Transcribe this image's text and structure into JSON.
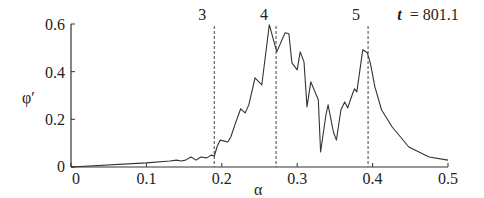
{
  "chart_data": {
    "type": "line",
    "title": "",
    "xlabel": "α",
    "ylabel": "φ′",
    "xlim": [
      0,
      0.5
    ],
    "ylim": [
      0,
      0.6
    ],
    "grid": false,
    "legend": null,
    "x_ticks": [
      "0",
      "0.1",
      "0.2",
      "0.3",
      "0.4",
      "0.5"
    ],
    "y_ticks": [
      "0",
      "0.2",
      "0.4",
      "0.6"
    ],
    "annotation": {
      "t_label": "t",
      "t_value": "= 801.1"
    },
    "vlines": [
      {
        "label": "3",
        "x": 0.19
      },
      {
        "label": "4",
        "x": 0.272
      },
      {
        "label": "5",
        "x": 0.394
      }
    ],
    "series": [
      {
        "name": "φ′",
        "x": [
          0.0,
          0.1,
          0.131,
          0.14,
          0.146,
          0.152,
          0.159,
          0.166,
          0.172,
          0.18,
          0.186,
          0.19,
          0.194,
          0.198,
          0.208,
          0.212,
          0.218,
          0.225,
          0.231,
          0.236,
          0.244,
          0.253,
          0.263,
          0.273,
          0.284,
          0.289,
          0.293,
          0.3,
          0.304,
          0.309,
          0.313,
          0.318,
          0.328,
          0.331,
          0.338,
          0.341,
          0.348,
          0.352,
          0.358,
          0.363,
          0.367,
          0.373,
          0.376,
          0.379,
          0.387,
          0.393,
          0.397,
          0.403,
          0.412,
          0.426,
          0.448,
          0.475,
          0.5
        ],
        "y": [
          0.0,
          0.017,
          0.025,
          0.029,
          0.025,
          0.029,
          0.042,
          0.029,
          0.042,
          0.038,
          0.05,
          0.046,
          0.088,
          0.113,
          0.105,
          0.126,
          0.183,
          0.244,
          0.227,
          0.262,
          0.374,
          0.345,
          0.597,
          0.483,
          0.563,
          0.559,
          0.437,
          0.408,
          0.483,
          0.441,
          0.252,
          0.357,
          0.282,
          0.063,
          0.218,
          0.261,
          0.147,
          0.113,
          0.239,
          0.273,
          0.248,
          0.303,
          0.328,
          0.315,
          0.492,
          0.479,
          0.437,
          0.336,
          0.239,
          0.168,
          0.084,
          0.042,
          0.029
        ]
      }
    ]
  }
}
